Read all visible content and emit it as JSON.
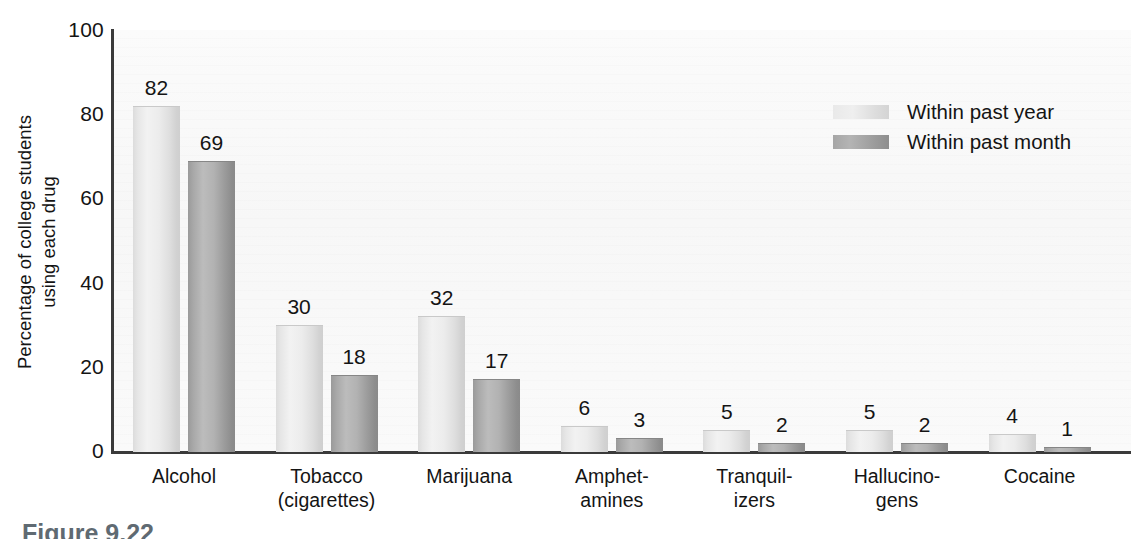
{
  "chart_data": {
    "type": "bar",
    "title": "",
    "xlabel": "",
    "ylabel": "Percentage of college students\nusing each drug",
    "ylabel_line1": "Percentage of college students",
    "ylabel_line2": "using each drug",
    "ylim": [
      0,
      100
    ],
    "yticks": [
      0,
      20,
      40,
      60,
      80,
      100
    ],
    "ytick_labels": [
      "0",
      "20",
      "40",
      "60",
      "80",
      "100"
    ],
    "grid": false,
    "legend_position": "upper right",
    "categories": [
      "Alcohol",
      "Tobacco\n(cigarettes)",
      "Marijuana",
      "Amphet-\namines",
      "Tranquil-\nizers",
      "Hallucino-\ngens",
      "Cocaine"
    ],
    "series": [
      {
        "name": "Within past year",
        "color": "#e6e6e6",
        "values": [
          82,
          30,
          32,
          6,
          5,
          5,
          4
        ]
      },
      {
        "name": "Within past month",
        "color": "#a5a5a5",
        "values": [
          69,
          18,
          17,
          3,
          2,
          2,
          1
        ]
      }
    ]
  },
  "legend": {
    "items": [
      {
        "label": "Within past year",
        "swatch": "light"
      },
      {
        "label": "Within past month",
        "swatch": "dark"
      }
    ]
  },
  "caption": {
    "text": "Figure 9.22"
  }
}
